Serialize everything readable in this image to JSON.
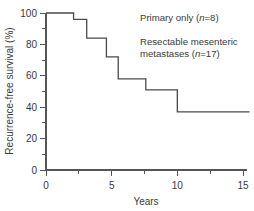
{
  "chart_data": {
    "type": "line",
    "title": "",
    "xlabel": "Years",
    "ylabel": "Recurrence-free survival (%)",
    "xlim": [
      0,
      15.6
    ],
    "ylim": [
      0,
      100
    ],
    "xticks": [
      0,
      5,
      10,
      15
    ],
    "xtick_labels": [
      "0",
      "5",
      "10",
      "15"
    ],
    "xminor_ticks": [
      2.5,
      7.5,
      12.5
    ],
    "yticks": [
      0,
      20,
      40,
      60,
      80,
      100
    ],
    "ytick_labels": [
      "0",
      "20",
      "40",
      "60",
      "80",
      "100"
    ],
    "yminor_ticks": [
      10,
      30,
      50,
      70,
      90
    ],
    "grid": false,
    "legend_position": "inside-top-right",
    "step_style": "post",
    "series": [
      {
        "name": "Resectable mesenteric metastases",
        "x": [
          0,
          2.1,
          2.1,
          3.1,
          3.1,
          4.6,
          4.6,
          5.5,
          5.5,
          7.6,
          7.6,
          10.0,
          10.0,
          15.5
        ],
        "y": [
          100,
          100,
          96,
          96,
          84,
          84,
          72,
          72,
          58,
          58,
          51,
          51,
          37,
          37
        ]
      }
    ],
    "annotations": [
      {
        "name": "primary-only-annotation",
        "text_before": "Primary only (",
        "italic": "n",
        "text_after": "=8)",
        "x_frac": 0.56,
        "y_frac": 0.08
      },
      {
        "name": "resectable-annotation-line1",
        "text": "Resectable mesenteric",
        "x_frac": 0.56,
        "y_frac": 0.2
      },
      {
        "name": "resectable-annotation-line2",
        "text_before": "metastases (",
        "italic": "n",
        "text_after": "=17)",
        "x_frac": 0.56,
        "y_frac": 0.27
      }
    ],
    "colors": {
      "curve": "#4a4a4a",
      "axis": "#555555",
      "text": "#3a3a3a",
      "background": "#ffffff"
    }
  }
}
